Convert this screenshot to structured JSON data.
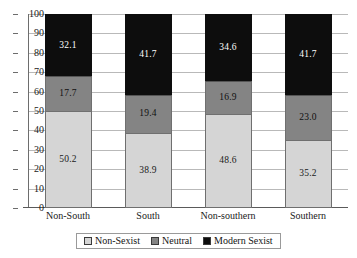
{
  "chart_data": {
    "type": "bar",
    "subtype": "stacked-percentage",
    "title": "",
    "subtitle": "",
    "xlabel": "",
    "ylabel": "",
    "categories": [
      "Non-South",
      "South",
      "Non-southern",
      "Southern"
    ],
    "series": [
      {
        "name": "Non-Sexist",
        "color": "#d5d5d5",
        "values": [
          50.2,
          38.9,
          48.6,
          35.2
        ]
      },
      {
        "name": "Neutral",
        "color": "#848484",
        "values": [
          17.7,
          19.4,
          16.9,
          23.0
        ]
      },
      {
        "name": "Modern Sexist",
        "color": "#0d0d0d",
        "values": [
          32.1,
          41.7,
          34.6,
          41.7
        ]
      }
    ],
    "ylim": [
      0,
      100
    ],
    "yticks": [
      0,
      10,
      20,
      30,
      40,
      50,
      60,
      70,
      80,
      90,
      100
    ],
    "ytick_labels": [
      "0",
      "10",
      "20",
      "30",
      "40",
      "50",
      "60",
      "70",
      "80",
      "90",
      "100"
    ],
    "grid": true,
    "grid_axis": "y",
    "legend_position": "bottom",
    "legend_entries": [
      "Non-Sexist",
      "Neutral",
      "Modern Sexist"
    ],
    "data_labels": [
      {
        "category": "Non-South",
        "Non-Sexist": "50.2",
        "Neutral": "17.7",
        "Modern Sexist": "32.1"
      },
      {
        "category": "South",
        "Non-Sexist": "38.9",
        "Neutral": "19.4",
        "Modern Sexist": "41.7"
      },
      {
        "category": "Non-southern",
        "Non-Sexist": "48.6",
        "Neutral": "16.9",
        "Modern Sexist": "34.6"
      },
      {
        "category": "Southern",
        "Non-Sexist": "35.2",
        "Neutral": "23.0",
        "Modern Sexist": "41.7"
      }
    ]
  }
}
